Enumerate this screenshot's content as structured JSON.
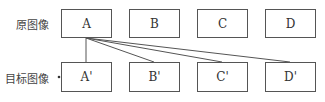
{
  "labels": {
    "source": "原图像",
    "target": "目标图像"
  },
  "source_row": [
    "A",
    "B",
    "C",
    "D"
  ],
  "target_row": [
    "A'",
    "B'",
    "C'",
    "D'"
  ],
  "connections": [
    {
      "from": "A",
      "to": "A'"
    },
    {
      "from": "A",
      "to": "B'"
    },
    {
      "from": "A",
      "to": "C'"
    },
    {
      "from": "A",
      "to": "D'"
    }
  ]
}
